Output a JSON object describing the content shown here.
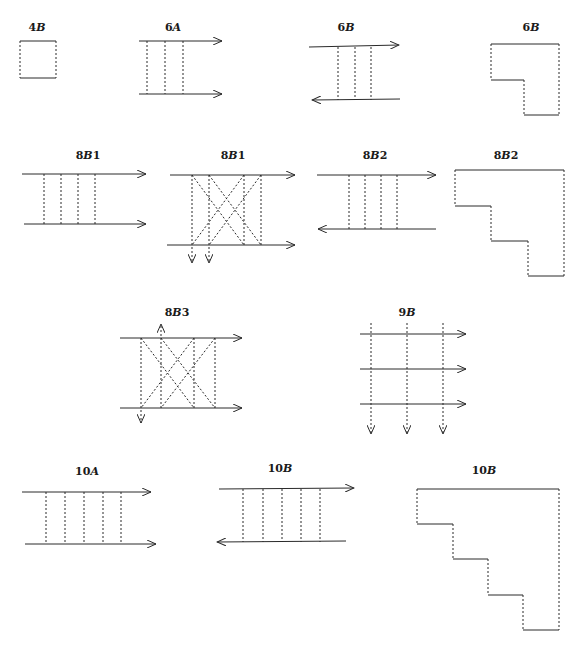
{
  "labels": {
    "d4B": "4B",
    "d6A": "6A",
    "d6B_flow": "6B",
    "d6B_shape": "6B",
    "d8B1_flow": "8B1",
    "d8B1_cross": "8B1",
    "d8B2_flow": "8B2",
    "d8B2_shape": "8B2",
    "d8B3": "8B3",
    "d9B": "9B",
    "d10A": "10A",
    "d10B_flow": "10B",
    "d10B_shape": "10B"
  },
  "colors": {
    "ink": "#2a2a2a",
    "background": "#ffffff"
  }
}
